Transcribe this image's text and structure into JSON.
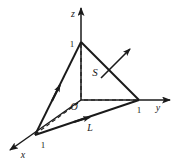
{
  "figure": {
    "background_color": "#ffffff",
    "stroke_color": "#1a1a1a",
    "axes": [
      {
        "name": "z-axis",
        "label": "z",
        "label_x": 73,
        "label_y": 16,
        "from": [
          81,
          100
        ],
        "to": [
          81,
          6
        ]
      },
      {
        "name": "y-axis",
        "label": "y",
        "label_x": 158,
        "label_y": 110,
        "from": [
          81,
          100
        ],
        "to": [
          172,
          100
        ]
      },
      {
        "name": "x-axis",
        "label": "x",
        "label_x": 22,
        "label_y": 157,
        "from": [
          81,
          100
        ],
        "to": [
          8,
          151
        ]
      }
    ],
    "ticks": [
      {
        "name": "tick-z-1",
        "label": "1",
        "x": 72,
        "y": 46
      },
      {
        "name": "tick-y-1",
        "label": "1",
        "x": 138,
        "y": 112
      },
      {
        "name": "tick-x-1",
        "label": "1",
        "x": 42,
        "y": 147
      }
    ],
    "origin": {
      "name": "origin",
      "label": "O",
      "x": 74,
      "y": 109
    },
    "plane_vertices": {
      "z_vertex": [
        81,
        42
      ],
      "y_vertex": [
        139,
        100
      ],
      "x_vertex": [
        35,
        135
      ]
    },
    "surface_label": {
      "name": "S",
      "text": "S",
      "x": 94,
      "y": 73
    },
    "curve_label": {
      "name": "L",
      "text": "L",
      "x": 89,
      "y": 130
    },
    "normal_vector": {
      "name": "normal-arrow",
      "from": [
        103,
        76
      ],
      "to": [
        129,
        50
      ]
    },
    "edge_direction_arrows": [
      {
        "name": "arrow-on-left-edge",
        "at": [
          58,
          89
        ],
        "angle_deg": -62
      },
      {
        "name": "arrow-on-bottom-edge",
        "at": [
          85,
          118
        ],
        "angle_deg": -19
      }
    ],
    "dashed_segments": [
      {
        "name": "dashed-z-to-origin",
        "from": [
          81,
          44
        ],
        "to": [
          81,
          100
        ]
      },
      {
        "name": "dashed-origin-to-y",
        "from": [
          83,
          100
        ],
        "to": [
          137,
          100
        ]
      },
      {
        "name": "dashed-origin-to-x",
        "from": [
          79,
          102
        ],
        "to": [
          37,
          133
        ]
      }
    ]
  }
}
